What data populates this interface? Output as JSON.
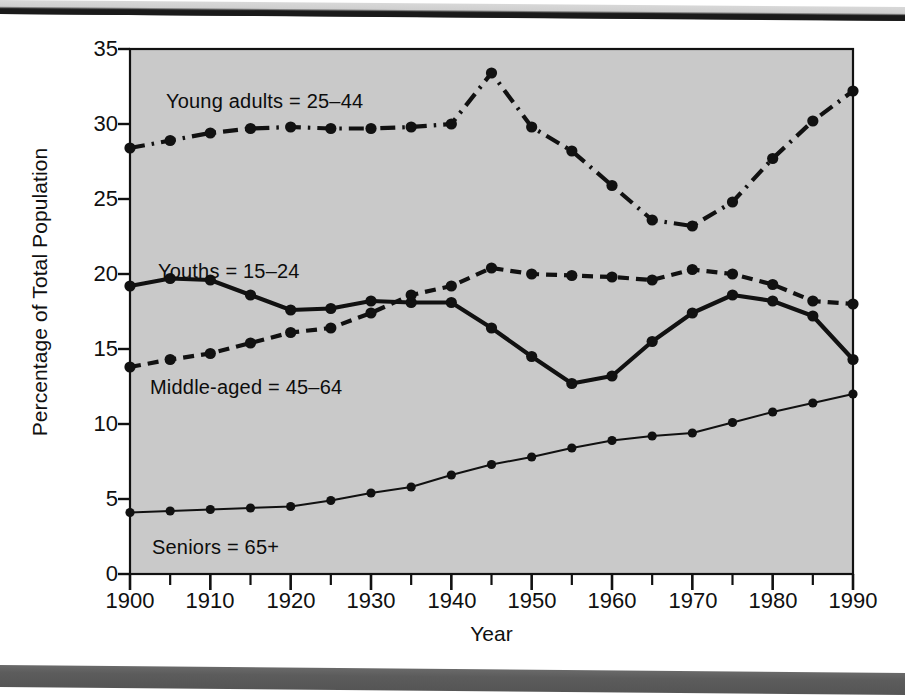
{
  "figure": {
    "plot_bg_color": "#c9c9c9",
    "ink_color": "#111111",
    "paper_color": "#ffffff"
  },
  "axis": {
    "y_title": "Percentage of Total Population",
    "x_title": "Year",
    "y_ticks": [
      "0",
      "5",
      "10",
      "15",
      "20",
      "25",
      "30",
      "35"
    ],
    "x_ticks": [
      "1900",
      "1910",
      "1920",
      "1930",
      "1940",
      "1950",
      "1960",
      "1970",
      "1980",
      "1990"
    ]
  },
  "series_labels": {
    "young_adults": "Young adults = 25–44",
    "youths": "Youths = 15–24",
    "middle_aged": "Middle-aged = 45–64",
    "seniors": "Seniors = 65+"
  },
  "chart_data": {
    "type": "line",
    "title": "",
    "xlabel": "Year",
    "ylabel": "Percentage of Total Population",
    "xlim": [
      1900,
      1990
    ],
    "ylim": [
      0,
      35
    ],
    "yticks": [
      0,
      5,
      10,
      15,
      20,
      25,
      30,
      35
    ],
    "xticks": [
      1900,
      1910,
      1920,
      1930,
      1940,
      1950,
      1960,
      1970,
      1980,
      1990
    ],
    "minor_xticks_every": 5,
    "grid": false,
    "legend": "inline-annotations",
    "x": [
      1900,
      1905,
      1910,
      1915,
      1920,
      1925,
      1930,
      1935,
      1940,
      1945,
      1950,
      1955,
      1960,
      1965,
      1970,
      1975,
      1980,
      1985,
      1990
    ],
    "series": [
      {
        "name": "Young adults = 25–44",
        "style": "dash-dot",
        "linewidth": "thick",
        "marker": "circle",
        "values": [
          28.4,
          28.9,
          29.4,
          29.7,
          29.8,
          29.7,
          29.7,
          29.8,
          30.0,
          33.4,
          29.8,
          28.2,
          25.9,
          23.6,
          23.2,
          24.8,
          27.7,
          30.2,
          32.2
        ]
      },
      {
        "name": "Youths = 15–24",
        "style": "solid",
        "linewidth": "thick",
        "marker": "circle",
        "values": [
          19.2,
          19.7,
          19.6,
          18.6,
          17.6,
          17.7,
          18.2,
          18.1,
          18.1,
          16.4,
          14.5,
          12.7,
          13.2,
          15.5,
          17.4,
          18.6,
          18.2,
          17.2,
          14.3
        ]
      },
      {
        "name": "Middle-aged = 45–64",
        "style": "dashed",
        "linewidth": "thick",
        "marker": "circle",
        "values": [
          13.8,
          14.3,
          14.7,
          15.4,
          16.1,
          16.4,
          17.4,
          18.6,
          19.2,
          20.4,
          20.0,
          19.9,
          19.8,
          19.6,
          20.3,
          20.0,
          19.3,
          18.2,
          18.0
        ]
      },
      {
        "name": "Seniors = 65+",
        "style": "solid",
        "linewidth": "thin",
        "marker": "circle",
        "values": [
          4.1,
          4.2,
          4.3,
          4.4,
          4.5,
          4.9,
          5.4,
          5.8,
          6.6,
          7.3,
          7.8,
          8.4,
          8.9,
          9.2,
          9.4,
          10.1,
          10.8,
          11.4,
          12.0
        ]
      }
    ]
  }
}
